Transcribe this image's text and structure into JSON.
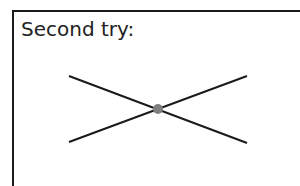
{
  "title": "Second try:",
  "diagram": {
    "lines": [
      {
        "x1": 69,
        "y1": 76,
        "x2": 247,
        "y2": 143
      },
      {
        "x1": 69,
        "y1": 142,
        "x2": 247,
        "y2": 76
      }
    ],
    "intersection": {
      "cx": 158,
      "cy": 109,
      "r": 5
    },
    "colors": {
      "line": "#1a1a1a",
      "point": "#7f7f7f"
    }
  }
}
